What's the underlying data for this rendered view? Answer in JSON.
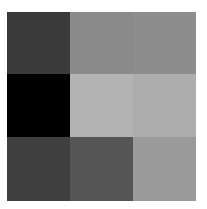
{
  "grid": {
    "rows": 3,
    "cols": 3,
    "cells": [
      [
        "#3a3a3a",
        "#8a8a8a",
        "#8d8d8d"
      ],
      [
        "#000000",
        "#b3b3b3",
        "#adadad"
      ],
      [
        "#3f3f3f",
        "#555555",
        "#9a9a9a"
      ]
    ]
  }
}
